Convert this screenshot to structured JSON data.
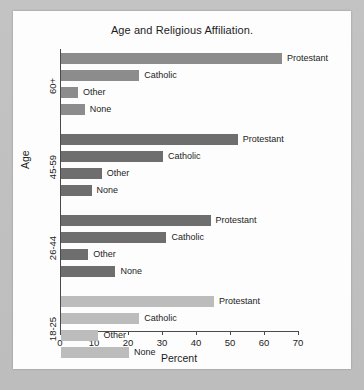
{
  "chart_data": {
    "type": "bar",
    "orientation": "horizontal",
    "title": "Age and Religious Affiliation.",
    "xlabel": "Percent",
    "ylabel": "Age",
    "xlim": [
      0,
      70
    ],
    "xticks": [
      0,
      10,
      20,
      30,
      40,
      50,
      60,
      70
    ],
    "xtick_labels": [
      "0",
      "10",
      "20",
      "30",
      "40",
      "50",
      "60",
      "70"
    ],
    "grid": false,
    "legend": "none",
    "categories": [
      "60+",
      "45-59",
      "26-44",
      "18-25"
    ],
    "affiliations": [
      "Protestant",
      "Catholic",
      "Other",
      "None"
    ],
    "groups": [
      {
        "category": "60+",
        "color": "#8c8c8c",
        "bars": [
          {
            "label": "Protestant",
            "value": 65
          },
          {
            "label": "Catholic",
            "value": 23
          },
          {
            "label": "Other",
            "value": 5
          },
          {
            "label": "None",
            "value": 7
          }
        ]
      },
      {
        "category": "45-59",
        "color": "#6e6e6e",
        "bars": [
          {
            "label": "Protestant",
            "value": 52
          },
          {
            "label": "Catholic",
            "value": 30
          },
          {
            "label": "Other",
            "value": 12
          },
          {
            "label": "None",
            "value": 9
          }
        ]
      },
      {
        "category": "26-44",
        "color": "#6e6e6e",
        "bars": [
          {
            "label": "Protestant",
            "value": 44
          },
          {
            "label": "Catholic",
            "value": 31
          },
          {
            "label": "Other",
            "value": 8
          },
          {
            "label": "None",
            "value": 16
          }
        ]
      },
      {
        "category": "18-25",
        "color": "#bcbcbc",
        "bars": [
          {
            "label": "Protestant",
            "value": 45
          },
          {
            "label": "Catholic",
            "value": 23
          },
          {
            "label": "Other",
            "value": 11
          },
          {
            "label": "None",
            "value": 20
          }
        ]
      }
    ]
  },
  "axis_colors": {
    "axis_line": "#4a4a4a",
    "text": "#1c1c1c",
    "card_background": "#fdfdfd",
    "page_background": "#bdbdbd"
  }
}
